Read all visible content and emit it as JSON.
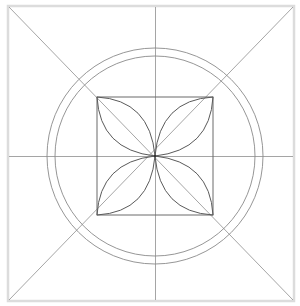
{
  "diagram": {
    "title": "",
    "colors": {
      "background": "#ffffff",
      "frame": "#dcdcdc",
      "guide_lines": "#8e8e8e",
      "circles": "#8a8a8a",
      "inner_square": "#6a6a6a",
      "petals": "#5a5a5a"
    },
    "frame": {
      "x1": 8,
      "y1": 6,
      "x2": 294,
      "y2": 301
    },
    "center": {
      "x": 155,
      "y": 156
    },
    "circles": [
      {
        "name": "outer",
        "r": 108
      },
      {
        "name": "inner",
        "r": 100
      }
    ],
    "inner_square": {
      "x1": 97,
      "y1": 97,
      "x2": 213,
      "y2": 215
    },
    "petals": [
      {
        "name": "top-left"
      },
      {
        "name": "top-right"
      },
      {
        "name": "bottom-left"
      },
      {
        "name": "bottom-right"
      }
    ]
  }
}
